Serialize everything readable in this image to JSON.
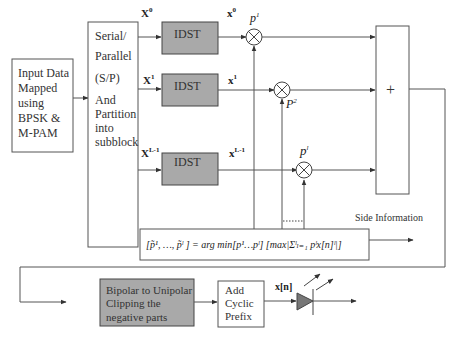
{
  "input_block": {
    "lines": [
      "Input Data",
      "Mapped",
      "using",
      "BPSK &",
      "M-PAM"
    ]
  },
  "sp_block": {
    "lines": [
      "Serial/",
      "Parallel",
      "(S/P)",
      "And",
      "Partition",
      "into",
      "subblock"
    ]
  },
  "branches": [
    {
      "input_label": "X",
      "input_sup": "0",
      "idst_label": "IDST",
      "output_label": "x",
      "output_sup": "0",
      "phase_label": "p",
      "phase_sup": "1"
    },
    {
      "input_label": "X",
      "input_sup": "1",
      "idst_label": "IDST",
      "output_label": "x",
      "output_sup": "1",
      "phase_label": "P",
      "phase_sup": "2"
    },
    {
      "input_label": "X",
      "input_sup": "L-1",
      "idst_label": "IDST",
      "output_label": "x",
      "output_sup": "L-1",
      "phase_label": "p",
      "phase_sup": "l"
    }
  ],
  "summer": {
    "symbol": "+"
  },
  "optimization": {
    "formula": "[p̃¹, …, p̃ˡ ] = arg min[p¹…pˡ] [max|Σˡₗ₌₁ pˡx[n]ˡ|]"
  },
  "side_info": {
    "label": "Side Information"
  },
  "clipping_block": {
    "lines": [
      "Bipolar to Unipolar",
      "Clipping the",
      "negative parts"
    ]
  },
  "cp_block": {
    "lines": [
      "Add",
      "Cyclic",
      "Prefix"
    ]
  },
  "led": {
    "signal_label": "x[n]"
  },
  "colors": {
    "gray_block": "#a9a9a9",
    "line": "#555555",
    "background": "#ffffff"
  }
}
